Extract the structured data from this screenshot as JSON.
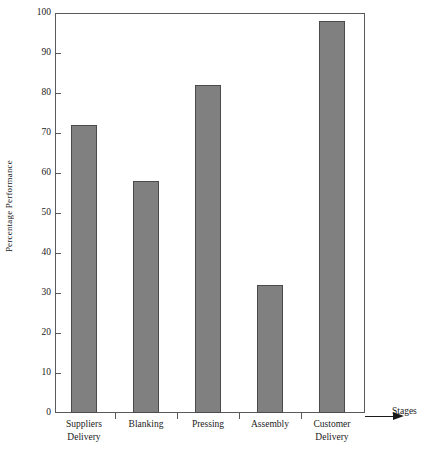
{
  "chart_data": {
    "type": "bar",
    "title": "",
    "subtitle": "",
    "xlabel": "Stages",
    "ylabel": "Percentage Performance",
    "categories": [
      "Suppliers Delivery",
      "Blanking",
      "Pressing",
      "Assembly",
      "Customer Delivery"
    ],
    "category_lines": [
      [
        "Suppliers",
        "Delivery"
      ],
      [
        "Blanking",
        ""
      ],
      [
        "Pressing",
        ""
      ],
      [
        "Assembly",
        ""
      ],
      [
        "Customer",
        "Delivery"
      ]
    ],
    "values": [
      72,
      58,
      82,
      32,
      98
    ],
    "ylim": [
      0,
      100
    ],
    "ytick_step": 10,
    "ytick_labels": [
      "0",
      "10",
      "20",
      "30",
      "40",
      "50",
      "60",
      "70",
      "80",
      "90",
      "100"
    ],
    "ytick_values": [
      0,
      10,
      20,
      30,
      40,
      50,
      60,
      70,
      80,
      90,
      100
    ],
    "grid": false,
    "legend": null,
    "legend_position": "none",
    "bar_color": "#808080",
    "bar_border_color": "#4a4a4a",
    "axis_color": "#5a5a5a",
    "background_color": "#ffffff",
    "frame": true,
    "x_axis_arrow": true
  }
}
